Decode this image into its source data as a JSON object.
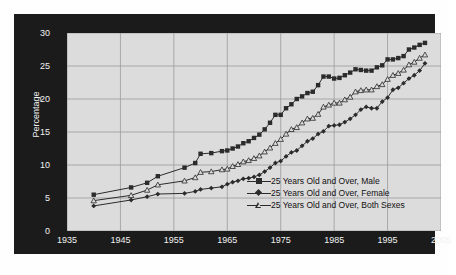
{
  "chart_data": {
    "type": "line",
    "title": "",
    "xlabel": "",
    "ylabel": "Percentage",
    "xlim": [
      1935,
      2005
    ],
    "ylim": [
      0,
      30
    ],
    "xticks": [
      1935,
      1945,
      1955,
      1965,
      1975,
      1985,
      1995,
      2005
    ],
    "yticks": [
      0,
      5,
      10,
      15,
      20,
      25,
      30
    ],
    "grid": true,
    "legend_position": "inside-lower-right",
    "series": [
      {
        "name": "25 Years Old and Over, Male",
        "marker": "filled-square",
        "color": "#2b2b2b",
        "x": [
          1940,
          1947,
          1950,
          1952,
          1957,
          1959,
          1960,
          1962,
          1964,
          1965,
          1966,
          1967,
          1968,
          1969,
          1970,
          1971,
          1972,
          1973,
          1974,
          1975,
          1976,
          1977,
          1978,
          1979,
          1980,
          1981,
          1982,
          1983,
          1984,
          1985,
          1986,
          1987,
          1988,
          1989,
          1990,
          1991,
          1992,
          1993,
          1994,
          1995,
          1996,
          1997,
          1998,
          1999,
          2000,
          2001,
          2002
        ],
        "y": [
          5.5,
          6.6,
          7.3,
          8.3,
          9.6,
          10.3,
          11.7,
          11.8,
          12.1,
          12.2,
          12.5,
          12.8,
          13.3,
          13.6,
          14.1,
          14.6,
          15.4,
          16.4,
          17.6,
          17.6,
          18.6,
          19.2,
          20.0,
          20.4,
          20.9,
          21.1,
          22.1,
          23.4,
          23.4,
          23.1,
          23.2,
          23.6,
          24.0,
          24.5,
          24.4,
          24.3,
          24.3,
          24.8,
          25.1,
          26.0,
          26.0,
          26.2,
          26.5,
          27.5,
          27.8,
          28.2,
          28.5
        ]
      },
      {
        "name": "25 Years Old and Over, Female",
        "marker": "filled-diamond",
        "color": "#2b2b2b",
        "x": [
          1940,
          1947,
          1950,
          1952,
          1957,
          1959,
          1960,
          1962,
          1964,
          1965,
          1966,
          1967,
          1968,
          1969,
          1970,
          1971,
          1972,
          1973,
          1974,
          1975,
          1976,
          1977,
          1978,
          1979,
          1980,
          1981,
          1982,
          1983,
          1984,
          1985,
          1986,
          1987,
          1988,
          1989,
          1990,
          1991,
          1992,
          1993,
          1994,
          1995,
          1996,
          1997,
          1998,
          1999,
          2000,
          2001,
          2002
        ],
        "y": [
          3.8,
          4.7,
          5.2,
          5.6,
          5.7,
          6.0,
          6.3,
          6.5,
          6.7,
          7.1,
          7.4,
          7.6,
          7.9,
          8.0,
          8.2,
          8.5,
          9.0,
          9.6,
          10.3,
          10.6,
          11.3,
          11.9,
          12.2,
          12.9,
          13.6,
          14.0,
          14.7,
          15.1,
          15.9,
          16.0,
          16.1,
          16.5,
          17.0,
          17.6,
          18.4,
          18.8,
          18.6,
          18.6,
          19.6,
          20.2,
          21.4,
          21.7,
          22.4,
          23.1,
          23.6,
          24.3,
          25.4
        ]
      },
      {
        "name": "25 Years Old and Over, Both Sexes",
        "marker": "open-triangle",
        "color": "#2b2b2b",
        "x": [
          1940,
          1947,
          1950,
          1952,
          1957,
          1959,
          1960,
          1962,
          1964,
          1965,
          1966,
          1967,
          1968,
          1969,
          1970,
          1971,
          1972,
          1973,
          1974,
          1975,
          1976,
          1977,
          1978,
          1979,
          1980,
          1981,
          1982,
          1983,
          1984,
          1985,
          1986,
          1987,
          1988,
          1989,
          1990,
          1991,
          1992,
          1993,
          1994,
          1995,
          1996,
          1997,
          1998,
          1999,
          2000,
          2001,
          2002
        ],
        "y": [
          4.6,
          5.4,
          6.2,
          7.0,
          7.6,
          8.1,
          8.9,
          9.0,
          9.3,
          9.4,
          9.8,
          10.1,
          10.5,
          10.7,
          11.0,
          11.4,
          12.0,
          12.6,
          13.3,
          13.9,
          14.7,
          15.4,
          15.7,
          16.4,
          17.0,
          17.1,
          17.7,
          18.8,
          19.1,
          19.4,
          19.4,
          19.9,
          20.3,
          21.1,
          21.3,
          21.4,
          21.4,
          21.9,
          22.2,
          23.0,
          23.6,
          23.9,
          24.4,
          25.2,
          25.6,
          26.2,
          26.7
        ]
      }
    ]
  },
  "axes": {
    "y_title": "Percentage",
    "y_tick_labels": [
      "0",
      "5",
      "10",
      "15",
      "20",
      "25",
      "30"
    ],
    "x_tick_labels": [
      "1935",
      "1945",
      "1955",
      "1965",
      "1975",
      "1985",
      "1995",
      "2005"
    ]
  },
  "legend": {
    "items": [
      {
        "label": "25 Years Old and Over, Male",
        "marker": "filled-square"
      },
      {
        "label": "25 Years Old and Over, Female",
        "marker": "filled-diamond"
      },
      {
        "label": "25 Years Old and Over, Both Sexes",
        "marker": "open-triangle"
      }
    ]
  },
  "colors": {
    "frame": "#1b1b1b",
    "plot_background": "#dcdcdc",
    "gridline": "#9a9a9a",
    "series": "#2b2b2b",
    "tick_text": "#f2f2f2"
  }
}
